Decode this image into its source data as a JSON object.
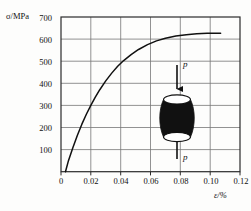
{
  "figure": {
    "background_color": "#fdfdfc",
    "frame_color": "#2b2b2b",
    "grid_color": "#6f6f6f",
    "curve_color": "#111111"
  },
  "axes": {
    "y_title": "σ/MPa",
    "x_title": "ε/%",
    "y_ticks": [
      "700",
      "600",
      "500",
      "400",
      "300",
      "200",
      "100"
    ],
    "x_ticks": [
      "0",
      "0.02",
      "0.04",
      "0.06",
      "0.08",
      "0.10",
      "0.12"
    ]
  },
  "specimen": {
    "top_load_label": "p",
    "bottom_load_label": "p",
    "fill_color": "#111111",
    "shape": "barrel-compression-specimen"
  },
  "chart_data": {
    "type": "line",
    "title": "",
    "xlabel": "ε/%",
    "ylabel": "σ/MPa",
    "xlim": [
      0,
      0.12
    ],
    "ylim": [
      0,
      700
    ],
    "xticks": [
      0,
      0.02,
      0.04,
      0.06,
      0.08,
      0.1,
      0.12
    ],
    "yticks": [
      0,
      100,
      200,
      300,
      400,
      500,
      600,
      700
    ],
    "grid": true,
    "legend": null,
    "series": [
      {
        "name": "stress-strain curve",
        "x": [
          0.003,
          0.005,
          0.008,
          0.011,
          0.014,
          0.017,
          0.02,
          0.023,
          0.026,
          0.03,
          0.034,
          0.038,
          0.042,
          0.047,
          0.052,
          0.058,
          0.064,
          0.07,
          0.077,
          0.084,
          0.091,
          0.098,
          0.103,
          0.107
        ],
        "y": [
          0,
          50,
          110,
          165,
          215,
          260,
          300,
          337,
          371,
          411,
          446,
          477,
          503,
          530,
          553,
          575,
          592,
          604,
          614,
          620,
          624,
          626,
          626,
          626
        ]
      }
    ],
    "annotations": [
      {
        "text": "p",
        "role": "top compression load arrow"
      },
      {
        "text": "p",
        "role": "bottom compression load arrow"
      }
    ]
  }
}
